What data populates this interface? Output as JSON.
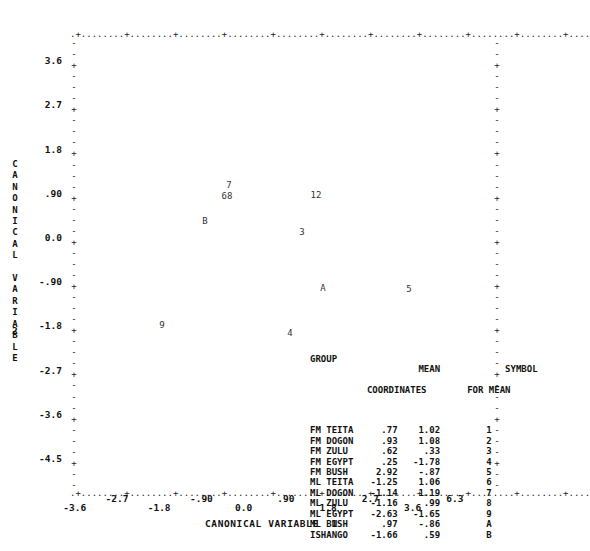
{
  "chart_data": {
    "type": "scatter",
    "title": "",
    "xlabel": "CANONICAL VARIABLE  1",
    "ylabel": "CANONICAL VARIABLE",
    "ylabel_number": "2",
    "xlim": [
      -4.05,
      4.95
    ],
    "ylim": [
      -4.95,
      4.05
    ],
    "xticks": [
      "-3.6",
      "-2.7",
      "-1.8",
      "-.90",
      "0.0",
      ".90",
      "1.8",
      "2.7",
      "3.6",
      "6.3"
    ],
    "xtick_values": [
      -3.6,
      -2.7,
      -1.8,
      -0.9,
      0.0,
      0.9,
      1.8,
      2.7,
      3.6,
      4.5
    ],
    "yticks": [
      "3.6",
      "2.7",
      "1.8",
      ".90",
      "0.0",
      "-.90",
      "-1.8",
      "-2.7",
      "-3.6",
      "-4.5"
    ],
    "ytick_values": [
      3.6,
      2.7,
      1.8,
      0.9,
      0.0,
      -0.9,
      -1.8,
      -2.7,
      -3.6,
      -4.5
    ],
    "grid": false,
    "legend_position": "inside-bottom-right",
    "points": [
      {
        "symbol": "1",
        "group": "FM TEITA",
        "x": 0.77,
        "y": 1.02
      },
      {
        "symbol": "2",
        "group": "FM DOGON",
        "x": 0.93,
        "y": 1.08
      },
      {
        "symbol": "3",
        "group": "FM ZULU",
        "x": 0.62,
        "y": 0.33
      },
      {
        "symbol": "4",
        "group": "FM EGYPT",
        "x": 0.25,
        "y": -1.78
      },
      {
        "symbol": "5",
        "group": "FM BUSH",
        "x": 2.92,
        "y": -0.87
      },
      {
        "symbol": "6",
        "group": "ML TEITA",
        "x": -1.25,
        "y": 1.06
      },
      {
        "symbol": "7",
        "group": "ML DOGON",
        "x": -1.14,
        "y": 1.19
      },
      {
        "symbol": "8",
        "group": "ML ZULU",
        "x": -1.16,
        "y": 0.99
      },
      {
        "symbol": "9",
        "group": "ML EGYPT",
        "x": -2.63,
        "y": -1.65
      },
      {
        "symbol": "A",
        "group": "ML BUSH",
        "x": 0.97,
        "y": -0.86
      },
      {
        "symbol": "B",
        "group": "ISHANGO",
        "x": -1.66,
        "y": 0.59
      }
    ]
  },
  "legend": {
    "headers": {
      "group": "GROUP",
      "mean_line1": "MEAN",
      "mean_line2": "COORDINATES",
      "symbol_line1": "SYMBOL",
      "symbol_line2": "FOR MEAN"
    },
    "rows": [
      {
        "group": "FM TEITA",
        "x": ".77",
        "y": "1.02",
        "symbol": "1"
      },
      {
        "group": "FM DOGON",
        "x": ".93",
        "y": "1.08",
        "symbol": "2"
      },
      {
        "group": "FM ZULU",
        "x": ".62",
        "y": ".33",
        "symbol": "3"
      },
      {
        "group": "FM EGYPT",
        "x": ".25",
        "y": "-1.78",
        "symbol": "4"
      },
      {
        "group": "FM BUSH",
        "x": "2.92",
        "y": "-.87",
        "symbol": "5"
      },
      {
        "group": "ML TEITA",
        "x": "-1.25",
        "y": "1.06",
        "symbol": "6"
      },
      {
        "group": "ML DOGON",
        "x": "-1.14",
        "y": "1.19",
        "symbol": "7"
      },
      {
        "group": "ML ZULU",
        "x": "-1.16",
        "y": ".99",
        "symbol": "8"
      },
      {
        "group": "ML EGYPT",
        "x": "-2.63",
        "y": "-1.65",
        "symbol": "9"
      },
      {
        "group": "ML BUSH",
        "x": ".97",
        "y": "-.86",
        "symbol": "A"
      },
      {
        "group": "ISHANGO",
        "x": "-1.66",
        "y": ".59",
        "symbol": "B"
      }
    ]
  },
  "plot_marks": {
    "m7": "7",
    "m68": "68",
    "m12": "12",
    "mB": "B",
    "m3": "3",
    "mA": "A",
    "m5": "5",
    "m9": "9",
    "m4": "4"
  },
  "frame": {
    "top_row": ".+........+........+........+........+........+........+........+........+........+........+....",
    "bottom_row": ".+........+........+........+........+........+........+........+........+........+........+....",
    "tick_dash": "-",
    "tick_major": "+"
  },
  "colors": {
    "ink": "#1a1a1a",
    "frame": "#222222",
    "background": "#ffffff"
  }
}
